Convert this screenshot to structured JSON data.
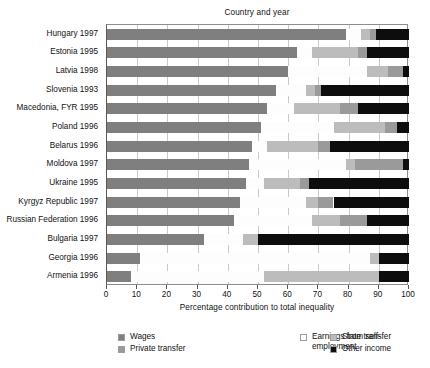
{
  "chart_data": {
    "type": "bar",
    "orientation": "horizontal",
    "stacked": true,
    "title": "",
    "ylabel": "Country and year",
    "xlabel": "Percentage contribution to total inequality",
    "xlim": [
      0,
      100
    ],
    "xticks": [
      0,
      10,
      20,
      30,
      40,
      50,
      60,
      70,
      80,
      90,
      100
    ],
    "xticklabels": [
      "0",
      "10",
      "20",
      "30",
      "40",
      "50",
      "60",
      "70",
      "80",
      "90",
      "100"
    ],
    "grid": "vertical",
    "legend_position": "bottom",
    "categories": [
      "Hungary 1997",
      "Estonia 1995",
      "Latvia 1998",
      "Slovenia 1993",
      "Macedonia, FYR 1995",
      "Poland 1996",
      "Belarus 1996",
      "Moldova 1997",
      "Ukraine 1995",
      "Kyrgyz Republic 1997",
      "Russian Federation 1996",
      "Bulgaria 1997",
      "Georgia 1996",
      "Armenia 1996"
    ],
    "series": [
      {
        "name": "Wages",
        "color": "#7f7f7f",
        "values": [
          79,
          63,
          60,
          56,
          53,
          51,
          48,
          47,
          46,
          44,
          42,
          32,
          11,
          8
        ]
      },
      {
        "name": "Earnings from self-employment",
        "color": "#fdfdfd",
        "values": [
          5,
          5,
          26,
          10,
          9,
          24,
          5,
          32,
          6,
          22,
          26,
          13,
          76,
          44
        ]
      },
      {
        "name": "State transfer",
        "color": "#bcbcbc",
        "values": [
          3,
          15,
          7,
          3,
          15,
          17,
          17,
          3,
          12,
          4,
          9,
          5,
          3,
          38
        ]
      },
      {
        "name": "Private transfer",
        "color": "#9a9a9a",
        "values": [
          2,
          3,
          5,
          2,
          6,
          4,
          4,
          16,
          3,
          5,
          9,
          0,
          0,
          0
        ]
      },
      {
        "name": "Other income",
        "color": "#0d0d0d",
        "values": [
          11,
          14,
          2,
          29,
          17,
          4,
          26,
          2,
          33,
          25,
          14,
          50,
          10,
          10
        ]
      }
    ],
    "stack_order": [
      "Wages",
      "Earnings from self-employment",
      "State transfer",
      "Private transfer",
      "Other income"
    ],
    "bars": [
      {
        "category": "Hungary 1997",
        "segments": [
          {
            "name": "Wages",
            "start": 0,
            "end": 79
          },
          {
            "name": "Earnings from self-employment",
            "start": 79,
            "end": 84
          },
          {
            "name": "State transfer",
            "start": 84,
            "end": 87
          },
          {
            "name": "Private transfer",
            "start": 87,
            "end": 89
          },
          {
            "name": "Other income",
            "start": 89,
            "end": 100
          }
        ]
      },
      {
        "category": "Estonia 1995",
        "segments": [
          {
            "name": "Wages",
            "start": 0,
            "end": 63
          },
          {
            "name": "Earnings from self-employment",
            "start": 63,
            "end": 68
          },
          {
            "name": "State transfer",
            "start": 68,
            "end": 83
          },
          {
            "name": "Private transfer",
            "start": 83,
            "end": 86
          },
          {
            "name": "Other income",
            "start": 86,
            "end": 100
          }
        ]
      },
      {
        "category": "Latvia 1998",
        "segments": [
          {
            "name": "Wages",
            "start": 0,
            "end": 60
          },
          {
            "name": "Earnings from self-employment",
            "start": 60,
            "end": 86
          },
          {
            "name": "State transfer",
            "start": 86,
            "end": 93
          },
          {
            "name": "Private transfer",
            "start": 93,
            "end": 98
          },
          {
            "name": "Other income",
            "start": 98,
            "end": 100
          }
        ]
      },
      {
        "category": "Slovenia 1993",
        "segments": [
          {
            "name": "Wages",
            "start": 0,
            "end": 56
          },
          {
            "name": "Earnings from self-employment",
            "start": 56,
            "end": 66
          },
          {
            "name": "State transfer",
            "start": 66,
            "end": 69
          },
          {
            "name": "Private transfer",
            "start": 69,
            "end": 71
          },
          {
            "name": "Other income",
            "start": 71,
            "end": 100
          }
        ]
      },
      {
        "category": "Macedonia, FYR 1995",
        "segments": [
          {
            "name": "Wages",
            "start": 0,
            "end": 53
          },
          {
            "name": "Earnings from self-employment",
            "start": 53,
            "end": 62
          },
          {
            "name": "State transfer",
            "start": 62,
            "end": 77
          },
          {
            "name": "Private transfer",
            "start": 77,
            "end": 83
          },
          {
            "name": "Other income",
            "start": 83,
            "end": 100
          }
        ]
      },
      {
        "category": "Poland 1996",
        "segments": [
          {
            "name": "Wages",
            "start": 0,
            "end": 51
          },
          {
            "name": "Earnings from self-employment",
            "start": 51,
            "end": 75
          },
          {
            "name": "State transfer",
            "start": 75,
            "end": 92
          },
          {
            "name": "Private transfer",
            "start": 92,
            "end": 96
          },
          {
            "name": "Other income",
            "start": 96,
            "end": 100
          }
        ]
      },
      {
        "category": "Belarus 1996",
        "segments": [
          {
            "name": "Wages",
            "start": 0,
            "end": 48
          },
          {
            "name": "Earnings from self-employment",
            "start": 48,
            "end": 53
          },
          {
            "name": "State transfer",
            "start": 53,
            "end": 70
          },
          {
            "name": "Private transfer",
            "start": 70,
            "end": 74
          },
          {
            "name": "Other income",
            "start": 74,
            "end": 100
          }
        ]
      },
      {
        "category": "Moldova 1997",
        "segments": [
          {
            "name": "Wages",
            "start": 0,
            "end": 47
          },
          {
            "name": "Earnings from self-employment",
            "start": 47,
            "end": 79
          },
          {
            "name": "State transfer",
            "start": 79,
            "end": 82
          },
          {
            "name": "Private transfer",
            "start": 82,
            "end": 98
          },
          {
            "name": "Other income",
            "start": 98,
            "end": 100
          }
        ]
      },
      {
        "category": "Ukraine 1995",
        "segments": [
          {
            "name": "Wages",
            "start": 0,
            "end": 46
          },
          {
            "name": "Earnings from self-employment",
            "start": 46,
            "end": 52
          },
          {
            "name": "State transfer",
            "start": 52,
            "end": 64
          },
          {
            "name": "Private transfer",
            "start": 64,
            "end": 67
          },
          {
            "name": "Other income",
            "start": 67,
            "end": 100
          }
        ]
      },
      {
        "category": "Kyrgyz Republic 1997",
        "segments": [
          {
            "name": "Wages",
            "start": 0,
            "end": 44
          },
          {
            "name": "Earnings from self-employment",
            "start": 44,
            "end": 66
          },
          {
            "name": "State transfer",
            "start": 66,
            "end": 70
          },
          {
            "name": "Private transfer",
            "start": 70,
            "end": 75
          },
          {
            "name": "Other income",
            "start": 75,
            "end": 100
          }
        ]
      },
      {
        "category": "Russian Federation 1996",
        "segments": [
          {
            "name": "Wages",
            "start": 0,
            "end": 42
          },
          {
            "name": "Earnings from self-employment",
            "start": 42,
            "end": 68
          },
          {
            "name": "State transfer",
            "start": 68,
            "end": 77
          },
          {
            "name": "Private transfer",
            "start": 77,
            "end": 86
          },
          {
            "name": "Other income",
            "start": 86,
            "end": 100
          }
        ]
      },
      {
        "category": "Bulgaria 1997",
        "segments": [
          {
            "name": "Wages",
            "start": 0,
            "end": 32
          },
          {
            "name": "Earnings from self-employment",
            "start": 32,
            "end": 45
          },
          {
            "name": "State transfer",
            "start": 45,
            "end": 50
          },
          {
            "name": "Other income",
            "start": 50,
            "end": 100
          }
        ]
      },
      {
        "category": "Georgia 1996",
        "segments": [
          {
            "name": "Wages",
            "start": 0,
            "end": 11
          },
          {
            "name": "Earnings from self-employment",
            "start": 11,
            "end": 87
          },
          {
            "name": "State transfer",
            "start": 87,
            "end": 90
          },
          {
            "name": "Other income",
            "start": 90,
            "end": 100
          }
        ]
      },
      {
        "category": "Armenia 1996",
        "segments": [
          {
            "name": "Wages",
            "start": 0,
            "end": 8
          },
          {
            "name": "Earnings from self-employment",
            "start": 8,
            "end": 52
          },
          {
            "name": "State transfer",
            "start": 52,
            "end": 90
          },
          {
            "name": "Other income",
            "start": 90,
            "end": 100
          }
        ]
      }
    ],
    "legend": [
      {
        "label": "Wages",
        "color": "#7f7f7f",
        "column": 0,
        "row": 0
      },
      {
        "label": "Private transfer",
        "color": "#9a9a9a",
        "column": 0,
        "row": 1
      },
      {
        "label": "Earnings from self-employment",
        "color": "#fdfdfd",
        "column": 1,
        "row": 0
      },
      {
        "label": "State transfer",
        "color": "#bcbcbc",
        "column": 2,
        "row": 0
      },
      {
        "label": "Other income",
        "color": "#0d0d0d",
        "column": 2,
        "row": 1
      }
    ]
  },
  "colors": {
    "background": "#ffffff",
    "gridline": "#c9c9c9",
    "axis": "#5a5a5a",
    "text": "#111111"
  }
}
